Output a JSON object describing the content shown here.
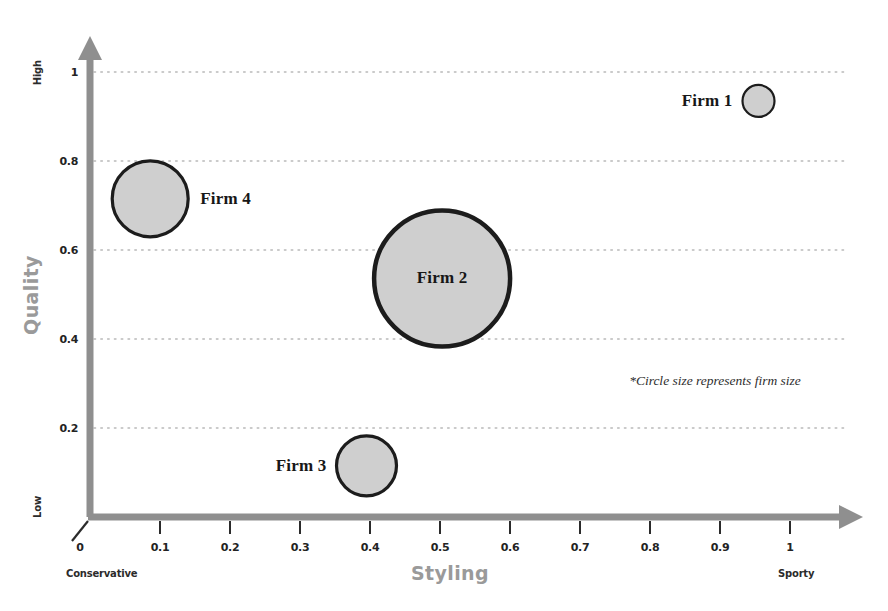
{
  "chart_data": {
    "type": "scatter",
    "title": "",
    "xlabel": "Styling",
    "ylabel": "Quality",
    "xlim": [
      0,
      1
    ],
    "ylim": [
      0,
      1
    ],
    "grid": true,
    "legend": null,
    "x_ticks": [
      "0",
      "0.1",
      "0.2",
      "0.3",
      "0.4",
      "0.5",
      "0.6",
      "0.7",
      "0.8",
      "0.9",
      "1"
    ],
    "x_tick_values": [
      0,
      0.1,
      0.2,
      0.3,
      0.4,
      0.5,
      0.6,
      0.7,
      0.8,
      0.9,
      1
    ],
    "y_ticks": [
      "0.2",
      "0.4",
      "0.6",
      "0.8",
      "1"
    ],
    "y_tick_values": [
      0.2,
      0.4,
      0.6,
      0.8,
      1
    ],
    "x_axis_low_label": "Conservative",
    "x_axis_high_label": "Sporty",
    "y_axis_low_label": "Low",
    "y_axis_high_label": "High",
    "annotation": "*Circle size represents firm size",
    "size_encoding": "Circle size represents firm size",
    "points": [
      {
        "label": "Firm 1",
        "x": 0.955,
        "y": 0.935,
        "size": 16,
        "label_position": "left"
      },
      {
        "label": "Firm 2",
        "x": 0.503,
        "y": 0.536,
        "size": 68,
        "label_position": "inside"
      },
      {
        "label": "Firm 3",
        "x": 0.395,
        "y": 0.115,
        "size": 30,
        "label_position": "left"
      },
      {
        "label": "Firm 4",
        "x": 0.086,
        "y": 0.715,
        "size": 38,
        "label_position": "right"
      }
    ]
  },
  "colors": {
    "axis": "#8f8f8f",
    "gridline": "#b9b9b9",
    "bubble_fill": "#cfcfcf",
    "bubble_stroke": "#1c1c1c",
    "axis_title": "#9a9a9a",
    "tick_label": "#232323",
    "background": "#ffffff"
  }
}
